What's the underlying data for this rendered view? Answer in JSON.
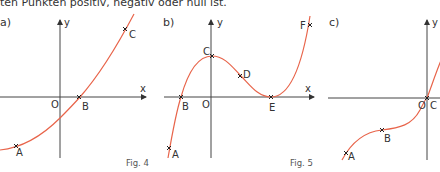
{
  "intro_text": "ten Punkten positiv, negativ oder null ist.",
  "colors": {
    "curve": "#e8644a",
    "axis": "#333333",
    "marker": "#222222"
  },
  "panels": [
    {
      "label": "a)",
      "fig": "Fig. 4",
      "axis_x": "x",
      "axis_y": "y",
      "origin": "O",
      "points": [
        "A",
        "B",
        "C"
      ]
    },
    {
      "label": "b)",
      "fig": "Fig. 5",
      "axis_x": "x",
      "axis_y": "y",
      "origin": "O",
      "points": [
        "A",
        "B",
        "C",
        "D",
        "E",
        "F"
      ]
    },
    {
      "label": "c)",
      "axis_y": "y",
      "origin": "O",
      "points": [
        "A",
        "B",
        "C"
      ]
    }
  ]
}
